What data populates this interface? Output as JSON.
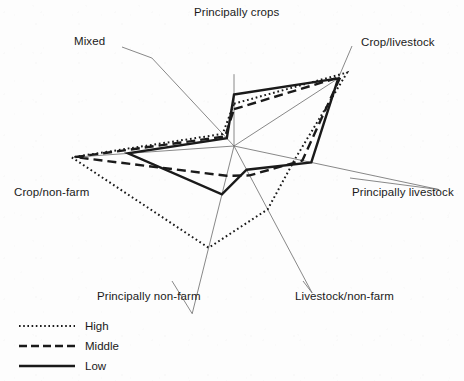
{
  "chart_data": {
    "type": "radar",
    "title": "",
    "subtitle": "",
    "xlabel": "",
    "ylabel": "",
    "grid": false,
    "legend_position": "bottom-left",
    "categories": [
      "Principally crops",
      "Crop/livestock",
      "Principally livestock",
      "Livestock/non-farm",
      "Principally non-farm",
      "Crop/non-farm",
      "Mixed"
    ],
    "axis_angles_deg": [
      -90,
      -33,
      12,
      62,
      104,
      176,
      -133
    ],
    "rmax": 100,
    "series": [
      {
        "name": "High",
        "style": "dotted",
        "color": "#1a1a1a",
        "values": [
          46,
          100,
          41,
          56,
          82,
          98,
          14
        ]
      },
      {
        "name": "Middle",
        "style": "dashed",
        "color": "#1a1a1a",
        "values": [
          40,
          94,
          46,
          26,
          24,
          96,
          11
        ]
      },
      {
        "name": "Low",
        "style": "solid",
        "color": "#1a1a1a",
        "values": [
          56,
          92,
          52,
          21,
          39,
          64,
          9
        ]
      }
    ]
  },
  "axis_labels": [
    {
      "name": "principally-crops",
      "text": "Principally crops",
      "x": 194,
      "y": 6,
      "anchor": "start"
    },
    {
      "name": "mixed",
      "text": "Mixed",
      "x": 74,
      "y": 35,
      "anchor": "start"
    },
    {
      "name": "crop-livestock",
      "text": "Crop/livestock",
      "x": 361,
      "y": 36,
      "anchor": "start"
    },
    {
      "name": "principally-livestock",
      "text": "Principally livestock",
      "x": 352,
      "y": 186,
      "anchor": "start"
    },
    {
      "name": "livestock-non-farm",
      "text": "Livestock/non-farm",
      "x": 295,
      "y": 290,
      "anchor": "start"
    },
    {
      "name": "principally-non-farm",
      "text": "Principally non-farm",
      "x": 97,
      "y": 290,
      "anchor": "start"
    },
    {
      "name": "crop-non-farm",
      "text": "Crop/non-farm",
      "x": 14,
      "y": 186,
      "anchor": "start"
    }
  ],
  "legend": {
    "items": [
      {
        "name": "high",
        "label": "High",
        "style": "dotted"
      },
      {
        "name": "middle",
        "label": "Middle",
        "style": "dashed"
      },
      {
        "name": "low",
        "label": "Low",
        "style": "solid"
      }
    ]
  },
  "colors": {
    "ink": "#1a1a1a",
    "spoke": "#6a6a6a",
    "leader": "#6a6a6a",
    "background": "#fdfdfd"
  },
  "geometry": {
    "center_x": 234,
    "center_y": 146
  }
}
